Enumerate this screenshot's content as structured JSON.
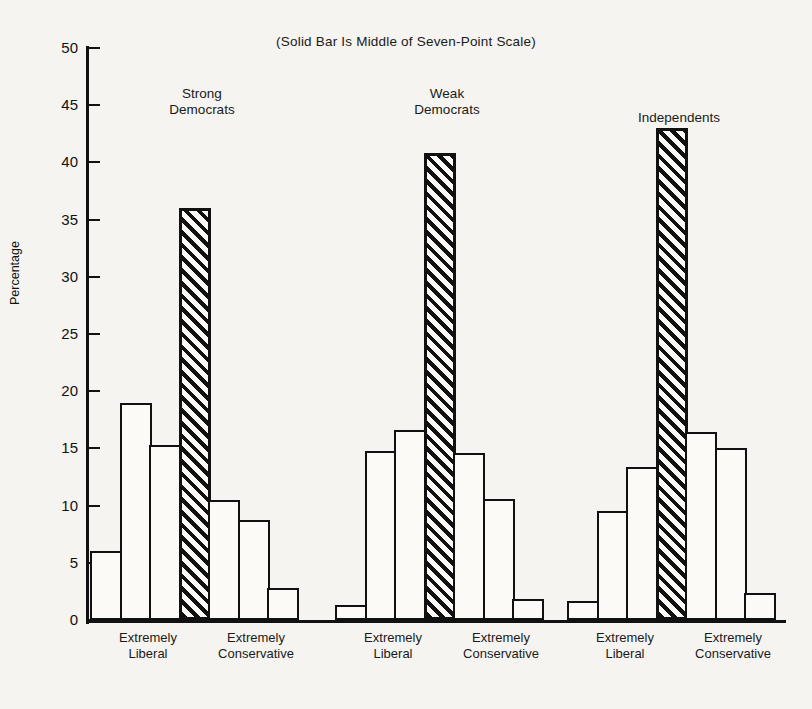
{
  "chart_data": {
    "type": "bar",
    "title": "(Solid Bar Is Middle of Seven-Point Scale)",
    "xlabel": "",
    "ylabel": "Percentage",
    "ylim": [
      0,
      50
    ],
    "ytick_labels": [
      "0",
      "5",
      "10",
      "15",
      "20",
      "25",
      "30",
      "35",
      "40",
      "45",
      "50"
    ],
    "yticks": [
      0,
      5,
      10,
      15,
      20,
      25,
      30,
      35,
      40,
      45,
      50
    ],
    "grid": false,
    "legend": "none",
    "scale_low_label": "Extremely\nLiberal",
    "scale_high_label": "Extremely\nConservative",
    "highlight_note": "Middle (4th) category of the seven-point scale is drawn as a hatched/solid bar",
    "categories": [
      "1",
      "2",
      "3",
      "4",
      "5",
      "6",
      "7"
    ],
    "groups": [
      {
        "name": "Strong\nDemocrats",
        "name_line1": "Strong",
        "name_line2": "Democrats",
        "values": [
          6.0,
          19.0,
          15.3,
          36.0,
          10.5,
          8.7,
          2.8
        ],
        "highlight_index": 3,
        "low_label_line1": "Extremely",
        "low_label_line2": "Liberal",
        "high_label_line1": "Extremely",
        "high_label_line2": "Conservative"
      },
      {
        "name": "Weak\nDemocrats",
        "name_line1": "Weak",
        "name_line2": "Democrats",
        "values": [
          1.3,
          14.8,
          16.6,
          40.8,
          14.6,
          10.6,
          1.8
        ],
        "highlight_index": 3,
        "low_label_line1": "Extremely",
        "low_label_line2": "Liberal",
        "high_label_line1": "Extremely",
        "high_label_line2": "Conservative"
      },
      {
        "name": "Independents",
        "name_line1": "Independents",
        "name_line2": "",
        "values": [
          1.7,
          9.5,
          13.4,
          43.0,
          16.4,
          15.0,
          2.4
        ],
        "highlight_index": 3,
        "low_label_line1": "Extremely",
        "low_label_line2": "Liberal",
        "high_label_line1": "Extremely",
        "high_label_line2": "Conservative"
      }
    ]
  },
  "colors": {
    "ink": "#111111",
    "paper": "#f5f4f0",
    "bar_fill": "#fbfaf7"
  }
}
